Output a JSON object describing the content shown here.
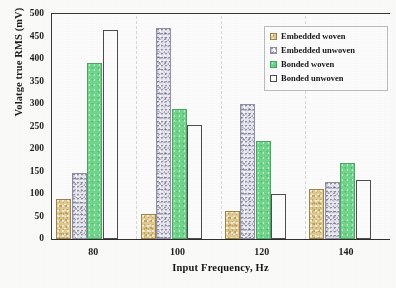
{
  "chart_data": {
    "type": "bar",
    "title": "",
    "xlabel": "Input Frequency, Hz",
    "ylabel": "Volatge true RMS (mV)",
    "categories": [
      "80",
      "100",
      "120",
      "140"
    ],
    "series": [
      {
        "name": "Embedded woven",
        "color": "#e3cb8e",
        "values": [
          88,
          56,
          63,
          111
        ]
      },
      {
        "name": "Embedded unwoven",
        "color": "#e9e9f2",
        "values": [
          147,
          470,
          301,
          126
        ]
      },
      {
        "name": "Bonded woven",
        "color": "#6fd78a",
        "values": [
          392,
          289,
          217,
          168
        ]
      },
      {
        "name": "Bonded unwoven",
        "color": "#ffffff",
        "values": [
          465,
          254,
          101,
          131
        ]
      }
    ],
    "ylim": [
      0,
      500
    ],
    "yticks": [
      "0",
      "50",
      "100",
      "150",
      "200",
      "250",
      "300",
      "350",
      "400",
      "450",
      "500"
    ],
    "grid": false,
    "legend_position": "top-right"
  },
  "legend": {
    "items": [
      {
        "label": "Embedded woven"
      },
      {
        "label": "Embedded unwoven"
      },
      {
        "label": "Bonded woven"
      },
      {
        "label": "Bonded unwoven"
      }
    ]
  }
}
